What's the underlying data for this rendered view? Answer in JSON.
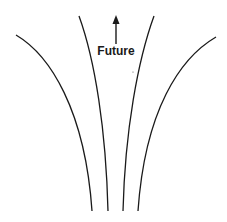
{
  "diagram": {
    "label": "Future",
    "arrow_direction": "up",
    "line_color": "#1a1a1a",
    "curve_count": 4
  }
}
